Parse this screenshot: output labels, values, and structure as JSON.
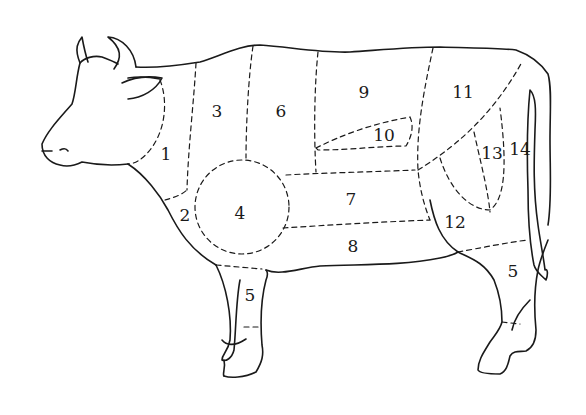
{
  "diagram": {
    "type": "beef cuts diagram",
    "line_color": "#1a1a1a",
    "background": "#ffffff",
    "regions": [
      {
        "id": "1",
        "label": "1",
        "x": 166,
        "y": 155
      },
      {
        "id": "2",
        "label": "2",
        "x": 185,
        "y": 216
      },
      {
        "id": "3",
        "label": "3",
        "x": 217,
        "y": 112
      },
      {
        "id": "4",
        "label": "4",
        "x": 240,
        "y": 214
      },
      {
        "id": "5a",
        "label": "5",
        "x": 250,
        "y": 296
      },
      {
        "id": "6",
        "label": "6",
        "x": 281,
        "y": 112
      },
      {
        "id": "7",
        "label": "7",
        "x": 351,
        "y": 200
      },
      {
        "id": "8",
        "label": "8",
        "x": 353,
        "y": 247
      },
      {
        "id": "9",
        "label": "9",
        "x": 364,
        "y": 93
      },
      {
        "id": "10",
        "label": "10",
        "x": 384,
        "y": 136
      },
      {
        "id": "11",
        "label": "11",
        "x": 463,
        "y": 93
      },
      {
        "id": "12",
        "label": "12",
        "x": 455,
        "y": 223
      },
      {
        "id": "13",
        "label": "13",
        "x": 492,
        "y": 154
      },
      {
        "id": "14",
        "label": "14",
        "x": 520,
        "y": 150
      },
      {
        "id": "5b",
        "label": "5",
        "x": 513,
        "y": 272
      }
    ]
  }
}
